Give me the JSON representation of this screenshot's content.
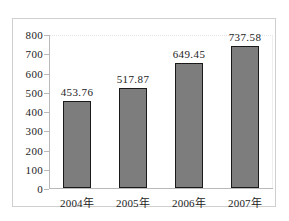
{
  "chart_data": {
    "type": "bar",
    "title": "",
    "xlabel": "",
    "ylabel": "",
    "categories": [
      "2004年",
      "2005年",
      "2006年",
      "2007年"
    ],
    "values": [
      453.76,
      517.87,
      649.45,
      737.58
    ],
    "value_labels": [
      "453.76",
      "517.87",
      "649.45",
      "737.58"
    ],
    "ylim": [
      0,
      800
    ],
    "ytick_step": 100,
    "ytick_labels": [
      "800",
      "700",
      "600",
      "500",
      "400",
      "300",
      "200",
      "100",
      "0"
    ],
    "ytick_values": [
      800,
      700,
      600,
      500,
      400,
      300,
      200,
      100,
      0
    ],
    "grid": "faint-dotted-top-only",
    "legend": null,
    "legend_position": "none",
    "series": [
      {
        "name": "",
        "values": [
          453.76,
          517.87,
          649.45,
          737.58
        ]
      }
    ],
    "colors": {
      "bar_fill": "#7d7d7d",
      "bar_border": "#1a1a1a",
      "axis_line": "#b9b9b9",
      "frame_border": "#cfcfcf",
      "text": "#1c1c1c",
      "background": "#ffffff"
    }
  }
}
